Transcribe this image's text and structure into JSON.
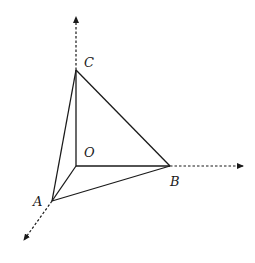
{
  "diagram": {
    "type": "3d-coordinate-tetrahedron",
    "colors": {
      "line": "#1a1a1a",
      "background": "#ffffff"
    },
    "points": {
      "O": {
        "label": "O",
        "x": 76,
        "y": 166
      },
      "A": {
        "label": "A",
        "x": 52,
        "y": 201
      },
      "B": {
        "label": "B",
        "x": 170,
        "y": 166
      },
      "C": {
        "label": "C",
        "x": 76,
        "y": 70
      }
    },
    "axes": [
      {
        "name": "z-axis",
        "from": "C",
        "to": [
          76,
          16
        ],
        "style": "dashed-arrow"
      },
      {
        "name": "x-axis",
        "from": "B",
        "to": [
          244,
          166
        ],
        "style": "dashed-arrow"
      },
      {
        "name": "y-axis",
        "from": "A",
        "to": [
          23,
          241
        ],
        "style": "dashed-arrow"
      }
    ],
    "edges": [
      [
        "O",
        "A"
      ],
      [
        "O",
        "B"
      ],
      [
        "O",
        "C"
      ],
      [
        "A",
        "B"
      ],
      [
        "B",
        "C"
      ],
      [
        "C",
        "A"
      ]
    ],
    "labels": {
      "C": {
        "text": "C",
        "x": 84,
        "y": 67
      },
      "O": {
        "text": "O",
        "x": 84,
        "y": 157
      },
      "B": {
        "text": "B",
        "x": 170,
        "y": 186
      },
      "A": {
        "text": "A",
        "x": 33,
        "y": 206
      }
    }
  }
}
